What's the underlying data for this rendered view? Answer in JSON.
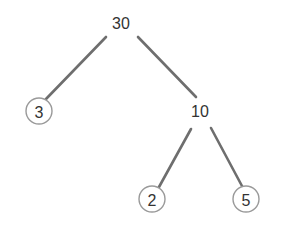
{
  "tree": {
    "root": {
      "label": "30"
    },
    "nodes": [
      {
        "id": "n30",
        "label": "30",
        "circled": false
      },
      {
        "id": "n3",
        "label": "3",
        "circled": true
      },
      {
        "id": "n10",
        "label": "10",
        "circled": false
      },
      {
        "id": "n2",
        "label": "2",
        "circled": true
      },
      {
        "id": "n5",
        "label": "5",
        "circled": true
      }
    ],
    "edges": [
      {
        "from": "30",
        "to": "3"
      },
      {
        "from": "30",
        "to": "10"
      },
      {
        "from": "10",
        "to": "2"
      },
      {
        "from": "10",
        "to": "5"
      }
    ]
  },
  "colors": {
    "edge": "#6e6e6e",
    "circle_stroke": "#9a9a9a",
    "text": "#333333",
    "background": "#ffffff"
  }
}
